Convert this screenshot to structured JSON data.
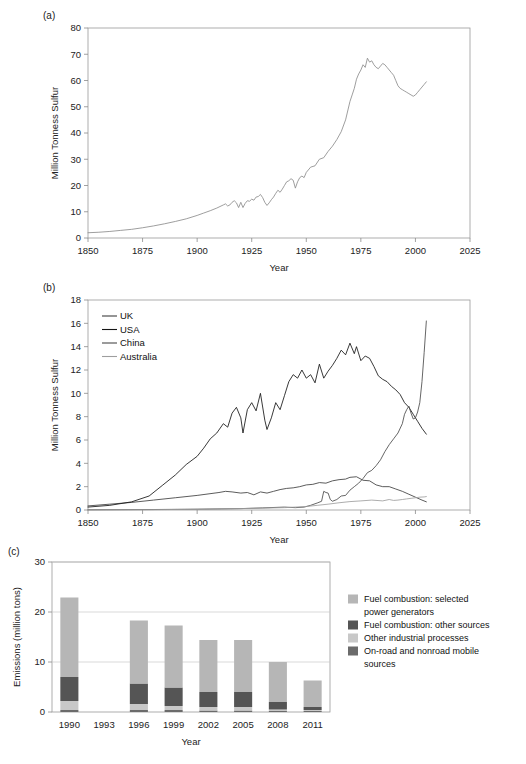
{
  "figure": {
    "panel_a_label": "(a)",
    "panel_b_label": "(b)",
    "panel_c_label": "(c)"
  },
  "chart_data": [
    {
      "id": "panel-a",
      "type": "line",
      "title": "",
      "xlabel": "Year",
      "ylabel": "Million Tonness Sulfur",
      "xlim": [
        1850,
        2025
      ],
      "ylim": [
        0,
        80
      ],
      "xticks": [
        1850,
        1875,
        1900,
        1925,
        1950,
        1975,
        2000,
        2025
      ],
      "yticks": [
        0,
        10,
        20,
        30,
        40,
        50,
        60,
        70,
        80
      ],
      "grid": false,
      "legend": "none",
      "series": [
        {
          "name": "Global sulfur emissions",
          "color": "#8c8c8c",
          "x": [
            1850,
            1855,
            1860,
            1865,
            1870,
            1875,
            1880,
            1885,
            1890,
            1895,
            1900,
            1903,
            1906,
            1909,
            1912,
            1913,
            1914,
            1915,
            1916,
            1917,
            1918,
            1919,
            1920,
            1921,
            1922,
            1923,
            1924,
            1925,
            1926,
            1927,
            1928,
            1929,
            1930,
            1931,
            1932,
            1933,
            1934,
            1935,
            1936,
            1937,
            1938,
            1939,
            1940,
            1941,
            1942,
            1943,
            1944,
            1945,
            1946,
            1947,
            1948,
            1949,
            1950,
            1952,
            1954,
            1956,
            1958,
            1960,
            1962,
            1964,
            1966,
            1968,
            1970,
            1971,
            1972,
            1973,
            1974,
            1975,
            1976,
            1977,
            1978,
            1979,
            1980,
            1981,
            1982,
            1983,
            1984,
            1985,
            1986,
            1987,
            1988,
            1989,
            1990,
            1991,
            1992,
            1993,
            1994,
            1995,
            1996,
            1997,
            1998,
            1999,
            2000,
            2001,
            2002,
            2003,
            2004,
            2005
          ],
          "y": [
            2.0,
            2.2,
            2.5,
            2.9,
            3.3,
            3.9,
            4.6,
            5.4,
            6.3,
            7.3,
            8.6,
            9.5,
            10.4,
            11.4,
            12.6,
            13.0,
            12.2,
            12.6,
            13.6,
            14.2,
            13.4,
            11.6,
            13.6,
            11.6,
            13.2,
            14.2,
            14.0,
            14.8,
            14.4,
            15.6,
            15.8,
            16.6,
            15.4,
            13.6,
            12.4,
            13.4,
            14.6,
            15.6,
            17.0,
            18.2,
            17.4,
            18.6,
            20.0,
            21.4,
            21.8,
            22.6,
            22.0,
            19.0,
            21.4,
            23.0,
            23.6,
            23.0,
            25.0,
            27.0,
            27.5,
            30.0,
            30.6,
            33.0,
            35.0,
            37.5,
            40.5,
            45.0,
            52.0,
            54.5,
            57.0,
            60.5,
            62.5,
            64.0,
            66.0,
            65.0,
            68.5,
            67.0,
            67.5,
            66.0,
            65.0,
            64.5,
            65.5,
            66.5,
            66.0,
            65.0,
            64.0,
            63.0,
            62.0,
            60.0,
            58.0,
            57.0,
            56.5,
            56.0,
            55.5,
            55.0,
            54.5,
            54.0,
            54.5,
            55.5,
            56.5,
            57.5,
            58.5,
            59.5
          ]
        }
      ]
    },
    {
      "id": "panel-b",
      "type": "line",
      "title": "",
      "xlabel": "Year",
      "ylabel": "Million Tonness Sulfur",
      "xlim": [
        1850,
        2025
      ],
      "ylim": [
        0,
        18
      ],
      "xticks": [
        1850,
        1875,
        1900,
        1925,
        1950,
        1975,
        2000,
        2025
      ],
      "yticks": [
        0,
        2,
        4,
        6,
        8,
        10,
        12,
        14,
        16,
        18
      ],
      "grid": false,
      "legend": "top-left",
      "legend_entries": [
        "UK",
        "USA",
        "China",
        "Australia"
      ],
      "series": [
        {
          "name": "UK",
          "color": "#3f3f3f",
          "x": [
            1850,
            1860,
            1870,
            1880,
            1890,
            1900,
            1910,
            1913,
            1916,
            1920,
            1923,
            1926,
            1929,
            1932,
            1935,
            1938,
            1941,
            1944,
            1947,
            1950,
            1953,
            1956,
            1959,
            1962,
            1965,
            1968,
            1970,
            1973,
            1976,
            1979,
            1982,
            1985,
            1988,
            1991,
            1994,
            1997,
            2000,
            2003,
            2005
          ],
          "y": [
            0.35,
            0.5,
            0.65,
            0.85,
            1.05,
            1.25,
            1.5,
            1.6,
            1.55,
            1.45,
            1.5,
            1.3,
            1.55,
            1.45,
            1.6,
            1.75,
            1.85,
            1.9,
            2.0,
            2.15,
            2.2,
            2.35,
            2.3,
            2.5,
            2.6,
            2.65,
            2.8,
            2.85,
            2.55,
            2.5,
            2.15,
            2.0,
            2.0,
            1.8,
            1.6,
            1.35,
            1.1,
            0.85,
            0.7
          ]
        },
        {
          "name": "USA",
          "color": "#151515",
          "x": [
            1850,
            1860,
            1870,
            1878,
            1884,
            1890,
            1895,
            1900,
            1903,
            1906,
            1909,
            1912,
            1914,
            1916,
            1918,
            1920,
            1921,
            1923,
            1925,
            1927,
            1929,
            1931,
            1932,
            1934,
            1936,
            1938,
            1940,
            1942,
            1944,
            1946,
            1948,
            1950,
            1952,
            1954,
            1956,
            1958,
            1960,
            1962,
            1964,
            1966,
            1968,
            1970,
            1972,
            1973,
            1975,
            1977,
            1979,
            1981,
            1983,
            1985,
            1987,
            1989,
            1991,
            1993,
            1995,
            1997,
            1999,
            2001,
            2003,
            2005
          ],
          "y": [
            0.25,
            0.4,
            0.7,
            1.2,
            2.1,
            3.0,
            3.9,
            4.6,
            5.3,
            6.1,
            6.6,
            7.4,
            7.1,
            8.3,
            8.8,
            7.9,
            6.6,
            8.6,
            9.2,
            8.5,
            10.0,
            7.7,
            6.9,
            7.9,
            9.2,
            8.6,
            9.8,
            11.0,
            11.6,
            11.3,
            12.0,
            11.3,
            11.6,
            10.9,
            12.5,
            11.3,
            11.9,
            12.4,
            13.0,
            13.7,
            13.3,
            14.3,
            13.4,
            14.0,
            12.8,
            13.2,
            13.0,
            12.3,
            11.5,
            11.2,
            11.0,
            10.6,
            10.3,
            9.9,
            9.2,
            8.8,
            8.2,
            7.6,
            7.0,
            6.5
          ]
        },
        {
          "name": "China",
          "color": "#4a4a4a",
          "x": [
            1850,
            1880,
            1900,
            1920,
            1930,
            1940,
            1945,
            1949,
            1952,
            1955,
            1957,
            1958,
            1959,
            1960,
            1961,
            1962,
            1964,
            1966,
            1968,
            1970,
            1972,
            1974,
            1976,
            1978,
            1980,
            1982,
            1984,
            1986,
            1988,
            1990,
            1992,
            1994,
            1995,
            1996,
            1997,
            1998,
            1999,
            2000,
            2001,
            2002,
            2003,
            2004,
            2005
          ],
          "y": [
            0.02,
            0.04,
            0.07,
            0.12,
            0.18,
            0.25,
            0.2,
            0.25,
            0.4,
            0.6,
            0.75,
            1.6,
            1.5,
            1.45,
            0.9,
            0.75,
            0.9,
            1.2,
            1.25,
            1.7,
            2.0,
            2.3,
            2.7,
            3.2,
            3.4,
            3.8,
            4.3,
            5.0,
            5.6,
            6.1,
            6.6,
            7.4,
            8.2,
            8.6,
            8.9,
            8.3,
            7.8,
            7.9,
            8.4,
            9.2,
            11.0,
            13.5,
            16.2
          ]
        },
        {
          "name": "Australia",
          "color": "#9e9e9e",
          "x": [
            1850,
            1880,
            1900,
            1920,
            1940,
            1950,
            1955,
            1960,
            1965,
            1970,
            1975,
            1980,
            1985,
            1988,
            1990,
            1992,
            1994,
            1996,
            1998,
            2000,
            2002,
            2004,
            2005
          ],
          "y": [
            0.01,
            0.03,
            0.06,
            0.12,
            0.2,
            0.3,
            0.4,
            0.5,
            0.62,
            0.72,
            0.78,
            0.85,
            0.78,
            0.9,
            0.82,
            0.85,
            0.9,
            0.95,
            1.0,
            1.05,
            1.1,
            1.12,
            1.15
          ]
        }
      ]
    },
    {
      "id": "panel-c",
      "type": "bar",
      "barmode": "stacked",
      "title": "",
      "xlabel": "Year",
      "ylabel": "Emissions (million tons)",
      "categories": [
        "1990",
        "1993",
        "1996",
        "1999",
        "2002",
        "2005",
        "2008",
        "2011"
      ],
      "yticks": [
        0,
        10,
        20,
        30
      ],
      "ylim": [
        0,
        30
      ],
      "grid": true,
      "legend": "right",
      "totals": [
        22.9,
        0,
        18.3,
        17.3,
        14.4,
        14.4,
        10.0,
        6.3
      ],
      "series": [
        {
          "name": "Fuel combustion: selected power generators",
          "color": "#b6b6b6",
          "values": [
            15.9,
            0,
            12.6,
            12.4,
            10.4,
            10.4,
            8.0,
            5.3
          ]
        },
        {
          "name": "Fuel combustion: other sources",
          "color": "#555555",
          "values": [
            4.8,
            0,
            4.1,
            3.7,
            3.0,
            3.0,
            1.5,
            0.6
          ]
        },
        {
          "name": "Other industrial processes",
          "color": "#c8c8c8",
          "values": [
            1.8,
            0,
            1.2,
            0.8,
            0.7,
            0.7,
            0.3,
            0.2
          ]
        },
        {
          "name": "On-road and nonroad mobile sources",
          "color": "#6b6b6b",
          "values": [
            0.4,
            0,
            0.4,
            0.4,
            0.3,
            0.3,
            0.2,
            0.2
          ]
        }
      ]
    }
  ]
}
